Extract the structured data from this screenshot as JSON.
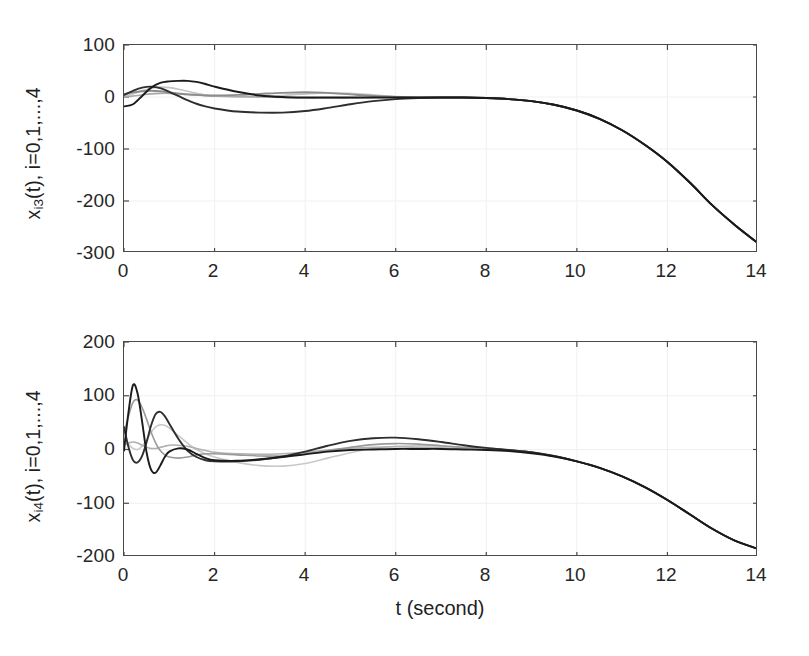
{
  "figure": {
    "background_color": "#ffffff",
    "axis_color": "#4a4a4a",
    "grid_color": "#f0f0f0",
    "width": 809,
    "height": 656
  },
  "xaxis": {
    "label": "t (second)",
    "ticks": [
      "0",
      "2",
      "4",
      "6",
      "8",
      "10",
      "12",
      "14"
    ],
    "min": 0,
    "max": 14
  },
  "panels": {
    "top": {
      "ylabel_main": "x",
      "ylabel_sub": "i3",
      "ylabel_tail": "(t), i=0,1,...,4",
      "yticks": [
        "100",
        "0",
        "-100",
        "-200",
        "-300"
      ],
      "ymin": -300,
      "ymax": 100
    },
    "bottom": {
      "ylabel_main": "x",
      "ylabel_sub": "i4",
      "ylabel_tail": "(t), i=0,1,...,4",
      "yticks": [
        "200",
        "100",
        "0",
        "-100",
        "-200"
      ],
      "ymin": -200,
      "ymax": 200
    }
  },
  "chart_data": [
    {
      "type": "line",
      "title": "",
      "xlabel": "t (second)",
      "ylabel": "x_i3(t), i=0,1,...,4",
      "xlim": [
        0,
        14
      ],
      "ylim": [
        -300,
        100
      ],
      "xticks": [
        0,
        2,
        4,
        6,
        8,
        10,
        12,
        14
      ],
      "yticks": [
        100,
        0,
        -100,
        -200,
        -300
      ],
      "grid": true,
      "legend": null,
      "x": [
        0,
        0.2,
        0.4,
        0.6,
        0.8,
        1.0,
        1.2,
        1.4,
        1.6,
        1.8,
        2.0,
        2.5,
        3.0,
        3.5,
        4.0,
        4.5,
        5.0,
        5.5,
        6.0,
        6.5,
        7.0,
        7.5,
        8.0,
        8.5,
        9.0,
        9.5,
        10.0,
        10.5,
        11.0,
        11.5,
        12.0,
        12.5,
        13.0,
        13.5,
        14.0
      ],
      "series": [
        {
          "name": "x_03(t)",
          "color": "#1a1a1a",
          "values": [
            -18,
            -14,
            2,
            18,
            27,
            30,
            31,
            31,
            29,
            25,
            20,
            10,
            3,
            0,
            -1,
            -1,
            -1,
            -1,
            -1,
            -1,
            -1,
            -1,
            -2,
            -4,
            -8,
            -15,
            -26,
            -42,
            -64,
            -92,
            -125,
            -165,
            -209,
            -247,
            -281
          ]
        },
        {
          "name": "x_13(t)",
          "color": "#2e2e2e",
          "values": [
            4,
            12,
            18,
            20,
            17,
            10,
            2,
            -6,
            -13,
            -18,
            -22,
            -28,
            -30,
            -30,
            -27,
            -21,
            -14,
            -8,
            -4,
            -2,
            -1,
            -1,
            -2,
            -4,
            -8,
            -15,
            -26,
            -42,
            -64,
            -92,
            -125,
            -165,
            -209,
            -247,
            -281
          ]
        },
        {
          "name": "x_23(t)",
          "color": "#8c8c8c",
          "values": [
            6,
            9,
            11,
            12,
            11,
            9,
            7,
            5,
            4,
            3,
            3,
            4,
            6,
            8,
            9,
            8,
            5,
            2,
            0,
            -1,
            -1,
            -1,
            -2,
            -4,
            -8,
            -15,
            -26,
            -42,
            -64,
            -92,
            -125,
            -165,
            -209,
            -247,
            -281
          ]
        },
        {
          "name": "x_33(t)",
          "color": "#c4c4c4",
          "values": [
            2,
            6,
            12,
            17,
            19,
            18,
            15,
            11,
            7,
            4,
            2,
            0,
            1,
            3,
            6,
            8,
            7,
            4,
            1,
            -1,
            -1,
            -1,
            -2,
            -4,
            -8,
            -15,
            -26,
            -42,
            -64,
            -92,
            -125,
            -165,
            -209,
            -247,
            -281
          ]
        },
        {
          "name": "x_43(t)",
          "color": "#a8a8a8",
          "values": [
            0,
            2,
            4,
            6,
            7,
            7,
            6,
            5,
            4,
            3,
            2,
            1,
            0,
            -1,
            -2,
            -2,
            -2,
            -1,
            -1,
            -1,
            -1,
            -1,
            -2,
            -4,
            -8,
            -15,
            -26,
            -42,
            -64,
            -92,
            -125,
            -165,
            -209,
            -247,
            -281
          ]
        }
      ]
    },
    {
      "type": "line",
      "title": "",
      "xlabel": "t (second)",
      "ylabel": "x_i4(t), i=0,1,...,4",
      "xlim": [
        0,
        14
      ],
      "ylim": [
        -200,
        200
      ],
      "xticks": [
        0,
        2,
        4,
        6,
        8,
        10,
        12,
        14
      ],
      "yticks": [
        200,
        100,
        0,
        -100,
        -200
      ],
      "grid": true,
      "legend": null,
      "x": [
        0,
        0.1,
        0.2,
        0.3,
        0.4,
        0.5,
        0.6,
        0.7,
        0.8,
        0.9,
        1.0,
        1.2,
        1.4,
        1.6,
        1.8,
        2.0,
        2.5,
        3.0,
        3.5,
        4.0,
        4.5,
        5.0,
        5.5,
        6.0,
        6.5,
        7.0,
        7.5,
        8.0,
        8.5,
        9.0,
        9.5,
        10.0,
        10.5,
        11.0,
        11.5,
        12.0,
        12.5,
        13.0,
        13.5,
        14.0
      ],
      "series": [
        {
          "name": "x_04(t)",
          "color": "#1a1a1a",
          "values": [
            -2,
            70,
            120,
            104,
            52,
            -6,
            -38,
            -43,
            -30,
            -14,
            -4,
            2,
            0,
            -8,
            -16,
            -20,
            -21,
            -18,
            -14,
            -9,
            -4,
            -1,
            0,
            1,
            1,
            1,
            0,
            -1,
            -3,
            -7,
            -13,
            -22,
            -34,
            -50,
            -70,
            -94,
            -121,
            -148,
            -170,
            -185
          ]
        },
        {
          "name": "x_14(t)",
          "color": "#2e2e2e",
          "values": [
            42,
            4,
            -20,
            -24,
            -12,
            14,
            45,
            66,
            70,
            62,
            48,
            20,
            -2,
            -14,
            -20,
            -22,
            -22,
            -19,
            -13,
            -4,
            7,
            16,
            21,
            22,
            19,
            14,
            8,
            3,
            -1,
            -5,
            -12,
            -22,
            -34,
            -50,
            -70,
            -94,
            -121,
            -148,
            -170,
            -185
          ]
        },
        {
          "name": "x_24(t)",
          "color": "#9a9a9a",
          "values": [
            30,
            62,
            88,
            92,
            78,
            56,
            32,
            12,
            -2,
            -10,
            -14,
            -16,
            -14,
            -10,
            -8,
            -8,
            -10,
            -12,
            -12,
            -8,
            -2,
            4,
            9,
            11,
            10,
            7,
            4,
            1,
            -1,
            -5,
            -12,
            -22,
            -34,
            -50,
            -70,
            -94,
            -121,
            -148,
            -170,
            -185
          ]
        },
        {
          "name": "x_34(t)",
          "color": "#c8c8c8",
          "values": [
            20,
            10,
            2,
            0,
            6,
            18,
            32,
            42,
            46,
            45,
            40,
            26,
            12,
            0,
            -8,
            -14,
            -24,
            -30,
            -31,
            -26,
            -16,
            -6,
            2,
            6,
            7,
            6,
            3,
            1,
            -1,
            -5,
            -12,
            -22,
            -34,
            -50,
            -70,
            -94,
            -121,
            -148,
            -170,
            -185
          ]
        },
        {
          "name": "x_44(t)",
          "color": "#b0b0b0",
          "values": [
            8,
            12,
            14,
            12,
            8,
            4,
            2,
            2,
            4,
            6,
            8,
            8,
            6,
            2,
            -2,
            -5,
            -8,
            -9,
            -8,
            -5,
            -1,
            2,
            4,
            5,
            4,
            3,
            1,
            0,
            -1,
            -5,
            -12,
            -22,
            -34,
            -50,
            -70,
            -94,
            -121,
            -148,
            -170,
            -185
          ]
        }
      ]
    }
  ]
}
